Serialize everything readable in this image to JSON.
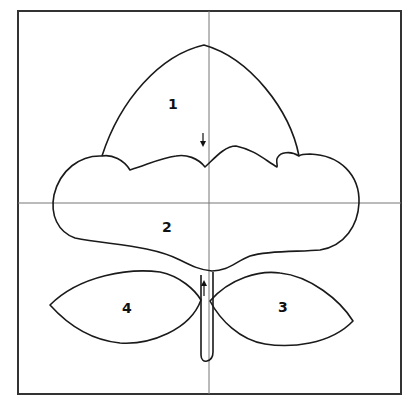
{
  "diagram": {
    "type": "template-pattern",
    "pieces": [
      {
        "id": "1",
        "label": "1",
        "name": "dome-top"
      },
      {
        "id": "2",
        "label": "2",
        "name": "cloud-body"
      },
      {
        "id": "3",
        "label": "3",
        "name": "right-leaf"
      },
      {
        "id": "4",
        "label": "4",
        "name": "left-leaf"
      }
    ],
    "arrows": [
      {
        "direction": "down",
        "location": "between piece 1 and 2"
      },
      {
        "direction": "up",
        "location": "stem"
      }
    ],
    "colors": {
      "stroke": "#1a1a1a",
      "grid": "#777777",
      "background": "#ffffff"
    }
  }
}
